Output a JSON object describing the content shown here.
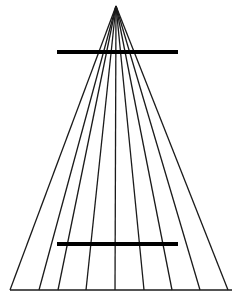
{
  "figure": {
    "name": "Ponzo illusion",
    "type": "line-diagram",
    "background_color": "#ffffff",
    "line_color": "#1a1a1a",
    "bar_color": "#000000",
    "canvas": {
      "width": 239,
      "height": 302
    }
  },
  "chart_data": {
    "type": "line",
    "subtitle": "Converging radial lines with two equal-length horizontal test bars",
    "xlabel": "",
    "ylabel": "",
    "xlim": [
      0,
      239
    ],
    "ylim": [
      302,
      0
    ],
    "grid": false,
    "legend": "none",
    "annotations": [],
    "apex": {
      "x": 116,
      "y": 6
    },
    "radiating_lines": {
      "count": 9,
      "stroke_width": 1.3,
      "color": "#1a1a1a",
      "description": "Nine straight lines radiating from a common apex near the top down to the baseline",
      "baseline_y": 290,
      "baseline_x_positions": [
        10,
        39,
        58,
        86,
        115,
        144,
        172,
        200,
        228
      ]
    },
    "baseline": {
      "x1": 10,
      "x2": 232,
      "y": 290,
      "stroke_width": 1.3,
      "color": "#1a1a1a"
    },
    "test_bars": [
      {
        "name": "upper-bar",
        "x1": 57,
        "x2": 178,
        "y": 52,
        "length_px": 121,
        "stroke_width": 4.2,
        "color": "#000000",
        "perceived": "appears longer"
      },
      {
        "name": "lower-bar",
        "x1": 57,
        "x2": 178,
        "y": 244,
        "length_px": 121,
        "stroke_width": 4.2,
        "color": "#000000",
        "perceived": "appears shorter"
      }
    ]
  }
}
